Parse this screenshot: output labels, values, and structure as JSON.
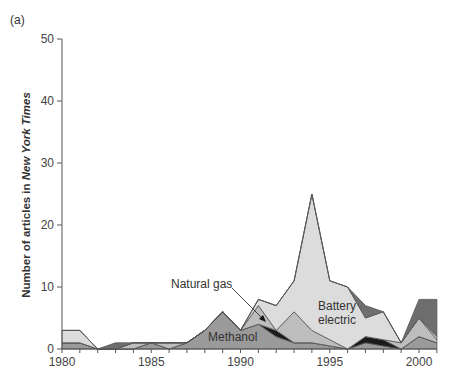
{
  "chart_data": {
    "type": "area",
    "stacked": true,
    "panel_label": "(a)",
    "title": "",
    "xlabel": "",
    "ylabel_prefix": "Number of articles in ",
    "ylabel_italic": "New York Times",
    "xlim": [
      1980,
      2001
    ],
    "ylim": [
      0,
      50
    ],
    "x_ticks": [
      1980,
      1985,
      1990,
      1995,
      2000
    ],
    "y_ticks": [
      0,
      10,
      20,
      30,
      40,
      50
    ],
    "grid": false,
    "x": [
      1980,
      1981,
      1982,
      1983,
      1984,
      1985,
      1986,
      1987,
      1988,
      1989,
      1990,
      1991,
      1992,
      1993,
      1994,
      1995,
      1996,
      1997,
      1998,
      1999,
      2000,
      2001
    ],
    "series": [
      {
        "name": "Methanol",
        "color": "#9a9a9a",
        "values": [
          1,
          1,
          0,
          0,
          0,
          1,
          0,
          1,
          3,
          6,
          3,
          4,
          2,
          1,
          1,
          0.5,
          0,
          1,
          0.5,
          0,
          2,
          1
        ]
      },
      {
        "name": "Dark series",
        "color": "#1a1a1a",
        "values": [
          0,
          0,
          0,
          0,
          0,
          0,
          0,
          0,
          0,
          0,
          0,
          0,
          1,
          0,
          0,
          0,
          0,
          1,
          1,
          0,
          0,
          0
        ]
      },
      {
        "name": "Natural gas",
        "color": "#bdbdbd",
        "values": [
          0,
          0,
          0,
          0,
          1,
          0,
          1,
          0,
          0,
          0,
          0,
          3,
          0,
          5,
          2,
          1,
          0,
          0,
          0,
          1,
          3,
          0.5
        ]
      },
      {
        "name": "Battery electric",
        "color": "#dcdcdc",
        "values": [
          2,
          2,
          0,
          0,
          0,
          0,
          0,
          0,
          0,
          0,
          0,
          1,
          4,
          5,
          22,
          9.5,
          10,
          3,
          4.5,
          0,
          0,
          0.5
        ]
      },
      {
        "name": "Dark gray series",
        "color": "#6e6e6e",
        "values": [
          0,
          0,
          0,
          1,
          0,
          0,
          0,
          0,
          0,
          0,
          0,
          0,
          0,
          0,
          0,
          0,
          0,
          2,
          0,
          0,
          3,
          6
        ]
      }
    ],
    "annotations": [
      {
        "text": "Natural gas",
        "points_to": {
          "x": 1992.3,
          "y": 3
        }
      },
      {
        "text": "Battery",
        "line2": "electric"
      },
      {
        "text": "Methanol"
      }
    ]
  }
}
